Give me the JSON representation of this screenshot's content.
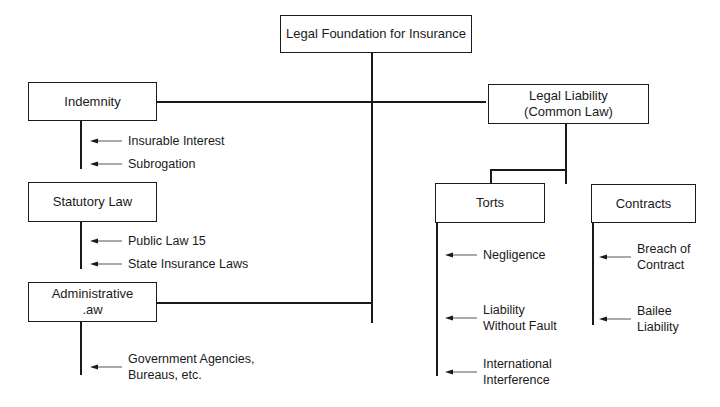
{
  "diagram": {
    "root": {
      "label": "Legal Foundation for Insurance"
    },
    "left": [
      {
        "label": "Indemnity",
        "items": [
          "Insurable Interest",
          "Subrogation"
        ]
      },
      {
        "label": "Statutory Law",
        "items": [
          "Public Law 15",
          "State Insurance Laws"
        ]
      },
      {
        "label": "Administrative\n.aw",
        "items": [
          "Government Agencies,\nBureaus, etc."
        ]
      }
    ],
    "right": {
      "label": "Legal Liability\n(Common Law)",
      "children": [
        {
          "label": "Torts",
          "items": [
            "Negligence",
            "Liability\nWithout Fault",
            "International\nInterference"
          ]
        },
        {
          "label": "Contracts",
          "items": [
            "Breach of\nContract",
            "Bailee\nLiability"
          ]
        }
      ]
    }
  },
  "colors": {
    "line": "#1a1a1a",
    "arrow": "#555555",
    "background": "#ffffff"
  }
}
